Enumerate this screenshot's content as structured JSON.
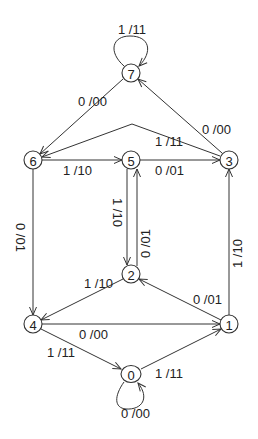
{
  "diagram": {
    "type": "state-machine",
    "nodes": [
      {
        "id": "0",
        "label": "0",
        "x": 131,
        "y": 374
      },
      {
        "id": "1",
        "label": "1",
        "x": 229,
        "y": 324
      },
      {
        "id": "2",
        "label": "2",
        "x": 131,
        "y": 274
      },
      {
        "id": "3",
        "label": "3",
        "x": 229,
        "y": 160
      },
      {
        "id": "4",
        "label": "4",
        "x": 33,
        "y": 324
      },
      {
        "id": "5",
        "label": "5",
        "x": 131,
        "y": 160
      },
      {
        "id": "6",
        "label": "6",
        "x": 33,
        "y": 160
      },
      {
        "id": "7",
        "label": "7",
        "x": 131,
        "y": 73
      }
    ],
    "edges": [
      {
        "from": "7",
        "to": "7",
        "label": "1 /11"
      },
      {
        "from": "7",
        "to": "6",
        "label": "0 /00"
      },
      {
        "from": "3",
        "to": "7",
        "label": "0 /00"
      },
      {
        "from": "3",
        "to": "6",
        "label": "1 /11"
      },
      {
        "from": "6",
        "to": "5",
        "label": "1 /10"
      },
      {
        "from": "5",
        "to": "3",
        "label": "0 /01"
      },
      {
        "from": "6",
        "to": "4",
        "label": "0 /01"
      },
      {
        "from": "5",
        "to": "2",
        "label": "1 /10"
      },
      {
        "from": "2",
        "to": "5",
        "label": "0 /01"
      },
      {
        "from": "1",
        "to": "3",
        "label": "1 /10"
      },
      {
        "from": "2",
        "to": "4",
        "label": "1 /10"
      },
      {
        "from": "1",
        "to": "2",
        "label": "0 /01"
      },
      {
        "from": "4",
        "to": "1",
        "label": "0 /00"
      },
      {
        "from": "4",
        "to": "0",
        "label": "1 /11"
      },
      {
        "from": "0",
        "to": "1",
        "label": "1 /11"
      },
      {
        "from": "0",
        "to": "0",
        "label": "0 /00"
      }
    ]
  }
}
